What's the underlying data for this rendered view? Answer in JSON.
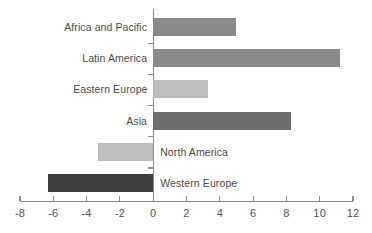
{
  "chart_data": {
    "type": "bar",
    "orientation": "horizontal",
    "title": "",
    "xlabel": "",
    "ylabel": "",
    "xlim": [
      -8,
      12
    ],
    "xticks": [
      -8,
      -6,
      -4,
      -2,
      0,
      2,
      4,
      6,
      8,
      10,
      12
    ],
    "xtick_labels": [
      "-8",
      "-6",
      "-4",
      "-2",
      "0",
      "2",
      "4",
      "6",
      "8",
      "10",
      "12"
    ],
    "grid": false,
    "legend": false,
    "categories": [
      "Africa and Pacific",
      "Latin America",
      "Eastern Europe",
      "Asia",
      "North America",
      "Western Europe"
    ],
    "values": [
      5.0,
      11.2,
      3.3,
      8.3,
      -3.3,
      -6.3
    ],
    "colors": [
      "#8a8a8a",
      "#8a8a8a",
      "#bdbdbd",
      "#6e6e6e",
      "#bdbdbd",
      "#3d3d3d"
    ],
    "bars": [
      {
        "category": "Africa and Pacific",
        "value": 5.0,
        "color": "#8a8a8a"
      },
      {
        "category": "Latin America",
        "value": 11.2,
        "color": "#8a8a8a"
      },
      {
        "category": "Eastern Europe",
        "value": 3.3,
        "color": "#bdbdbd"
      },
      {
        "category": "Asia",
        "value": 8.3,
        "color": "#6e6e6e"
      },
      {
        "category": "North America",
        "value": -3.3,
        "color": "#bdbdbd"
      },
      {
        "category": "Western Europe",
        "value": -6.3,
        "color": "#3d3d3d"
      }
    ],
    "axis_color": "#8c8c8c",
    "label_color": "#4c4c4c",
    "background": "#ffffff"
  }
}
